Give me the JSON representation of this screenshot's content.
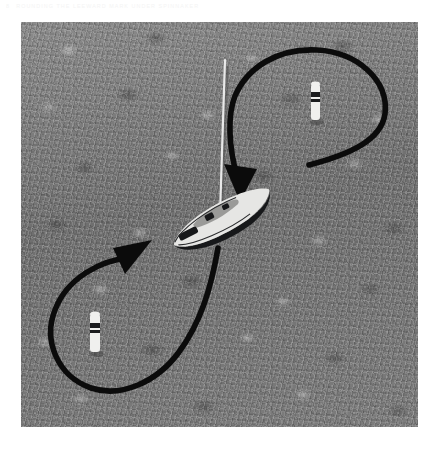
{
  "page": {
    "folio": "8",
    "running_title": "Rounding the Leeward Mark Under Spinnaker"
  },
  "figure": {
    "name": "sailing-maneuver-diagram",
    "panel": {
      "x": 21,
      "y": 22,
      "width": 397,
      "height": 405,
      "background_color": "#747474",
      "scene": "aerial view of water surface"
    },
    "colors": {
      "water_dark": "#6f6f6f",
      "water_light": "#8b8b8b",
      "arrow": "#0b0b0b",
      "hull_white": "#e6e6e4",
      "hull_dark": "#17181a",
      "buoy_white": "#f0f0ee",
      "buoy_band": "#1b1c1e"
    },
    "objects": [
      {
        "id": "sailboat",
        "label": "sailboat",
        "center_x": 218,
        "center_y": 215,
        "heading_deg": -28,
        "hull_length": 96,
        "hull_beam": 30,
        "mast_top_y": 58
      },
      {
        "id": "buoy-upper",
        "label": "upper mark buoy",
        "center_x": 315,
        "center_y": 97,
        "height": 26,
        "width": 8
      },
      {
        "id": "buoy-lower",
        "label": "lower mark buoy",
        "center_x": 94,
        "center_y": 320,
        "height": 26,
        "width": 8
      }
    ],
    "arrows": [
      {
        "id": "arrow-upper",
        "label": "upper course arrow",
        "direction": "clockwise loop around upper buoy, ending at boat bow",
        "tail_x": 305,
        "tail_y": 164,
        "head_x": 236,
        "head_y": 190,
        "head_angle_deg": 118
      },
      {
        "id": "arrow-lower",
        "label": "lower course arrow",
        "direction": "counter-clockwise loop around lower buoy, ending toward boat stern",
        "tail_x": 217,
        "tail_y": 244,
        "head_x": 142,
        "head_y": 250,
        "head_angle_deg": -36
      }
    ]
  }
}
